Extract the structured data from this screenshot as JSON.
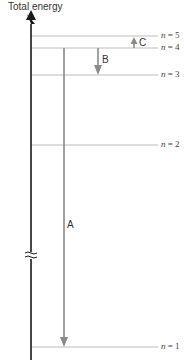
{
  "axis": {
    "title": "Total energy",
    "break_symbol": "≈"
  },
  "levels": [
    {
      "n": "5",
      "label_prefix": "n",
      "label_eq": " = 5",
      "y": 36
    },
    {
      "n": "4",
      "label_prefix": "n",
      "label_eq": " = 4",
      "y": 48
    },
    {
      "n": "3",
      "label_prefix": "n",
      "label_eq": " = 3",
      "y": 75
    },
    {
      "n": "2",
      "label_prefix": "n",
      "label_eq": " = 2",
      "y": 145
    },
    {
      "n": "1",
      "label_prefix": "n",
      "label_eq": " = 1",
      "y": 347
    }
  ],
  "transitions": [
    {
      "label": "A",
      "from": "4",
      "to": "1",
      "direction": "down"
    },
    {
      "label": "B",
      "from": "4",
      "to": "3",
      "direction": "down"
    },
    {
      "label": "C",
      "from": "4",
      "to": "5",
      "direction": "up"
    }
  ],
  "colors": {
    "axis": "#1a1a1a",
    "level_line": "#bdbdbd",
    "arrow": "#8a8a8a",
    "text": "#333333"
  }
}
